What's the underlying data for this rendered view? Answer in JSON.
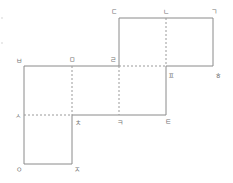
{
  "diagram": {
    "type": "cube-net",
    "colors": {
      "edge": "#8a8a8a",
      "fold": "#9a9a9a",
      "label": "#777777"
    },
    "labels": {
      "top_left": "ㄷ",
      "top_mid": "ㄴ",
      "top_right": "ㄱ",
      "left_top": "ㅂ",
      "mid_a": "ㅁ",
      "mid_b": "ㄹ",
      "right_mid_a": "ㅍ",
      "right_mid_b": "ㅎ",
      "left_mid": "ㅅ",
      "center_a": "ㅊ",
      "center_b": "ㅋ",
      "center_c": "ㅌ",
      "bottom_left": "ㅇ",
      "bottom_right": "ㅈ"
    }
  }
}
